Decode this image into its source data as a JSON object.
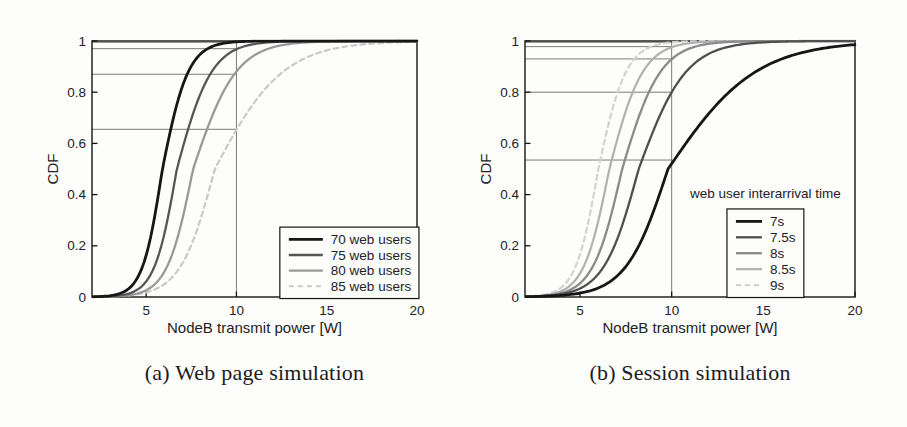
{
  "page": {
    "background": "#fdfdfc"
  },
  "figures": [
    {
      "id": "a",
      "caption": "(a) Web page simulation"
    },
    {
      "id": "b",
      "caption": "(b) Session simulation"
    }
  ],
  "chart_data": [
    {
      "type": "line",
      "subtype": "cdf",
      "title": "",
      "xlabel": "NodeB transmit power [W]",
      "ylabel": "CDF",
      "xlim": [
        2,
        20
      ],
      "ylim": [
        0,
        1
      ],
      "xticks": [
        5,
        10,
        15,
        20
      ],
      "yticks": [
        0,
        0.2,
        0.4,
        0.6,
        0.8,
        1
      ],
      "grid": false,
      "reference_x": 10,
      "legend": {
        "title": "",
        "position": "lower right",
        "box_frac": [
          0.578,
          0.727,
          1.006,
          1.006
        ],
        "title_fy": 0
      },
      "series": [
        {
          "name": "70 web users",
          "color": "#161616",
          "width": 2.8,
          "dash": "",
          "median": 5.9,
          "spread_lo": 0.55,
          "spread_hi": 0.72,
          "cdf_at_ref": 0.995
        },
        {
          "name": "75 web users",
          "color": "#565656",
          "width": 2.3,
          "dash": "",
          "median": 6.7,
          "spread_lo": 0.62,
          "spread_hi": 0.97,
          "cdf_at_ref": 0.97
        },
        {
          "name": "80 web users",
          "color": "#999999",
          "width": 2.3,
          "dash": "",
          "median": 7.6,
          "spread_lo": 0.72,
          "spread_hi": 1.2,
          "cdf_at_ref": 0.87
        },
        {
          "name": "85 web users",
          "color": "#c9c9c9",
          "width": 2.2,
          "dash": "5 4",
          "median": 8.8,
          "spread_lo": 0.95,
          "spread_hi": 1.9,
          "cdf_at_ref": 0.655
        }
      ]
    },
    {
      "type": "line",
      "subtype": "cdf",
      "title": "",
      "xlabel": "NodeB transmit power [W]",
      "ylabel": "CDF",
      "xlim": [
        2,
        20
      ],
      "ylim": [
        0,
        1
      ],
      "xticks": [
        5,
        10,
        15,
        20
      ],
      "yticks": [
        0,
        0.2,
        0.4,
        0.6,
        0.8,
        1
      ],
      "grid": false,
      "reference_x": 10,
      "legend": {
        "title": "web user interarrival time",
        "position": "lower right",
        "box_frac": [
          0.612,
          0.656,
          0.845,
          1.002
        ],
        "title_fy": 0.615
      },
      "series": [
        {
          "name": "7s",
          "color": "#161616",
          "width": 2.8,
          "dash": "",
          "median": 9.8,
          "spread_lo": 1.15,
          "spread_hi": 2.4,
          "cdf_at_ref": 0.535
        },
        {
          "name": "7.5s",
          "color": "#4f4f4f",
          "width": 2.3,
          "dash": "",
          "median": 8.2,
          "spread_lo": 0.95,
          "spread_hi": 1.3,
          "cdf_at_ref": 0.8
        },
        {
          "name": "8s",
          "color": "#8a8a8a",
          "width": 2.3,
          "dash": "",
          "median": 7.3,
          "spread_lo": 0.8,
          "spread_hi": 1.05,
          "cdf_at_ref": 0.93
        },
        {
          "name": "8.5s",
          "color": "#b0b0b0",
          "width": 2.2,
          "dash": "",
          "median": 6.6,
          "spread_lo": 0.7,
          "spread_hi": 0.92,
          "cdf_at_ref": 0.978
        },
        {
          "name": "9s",
          "color": "#d2d2d2",
          "width": 2.2,
          "dash": "5 4",
          "median": 6.0,
          "spread_lo": 0.62,
          "spread_hi": 0.76,
          "cdf_at_ref": 0.995
        }
      ]
    }
  ]
}
